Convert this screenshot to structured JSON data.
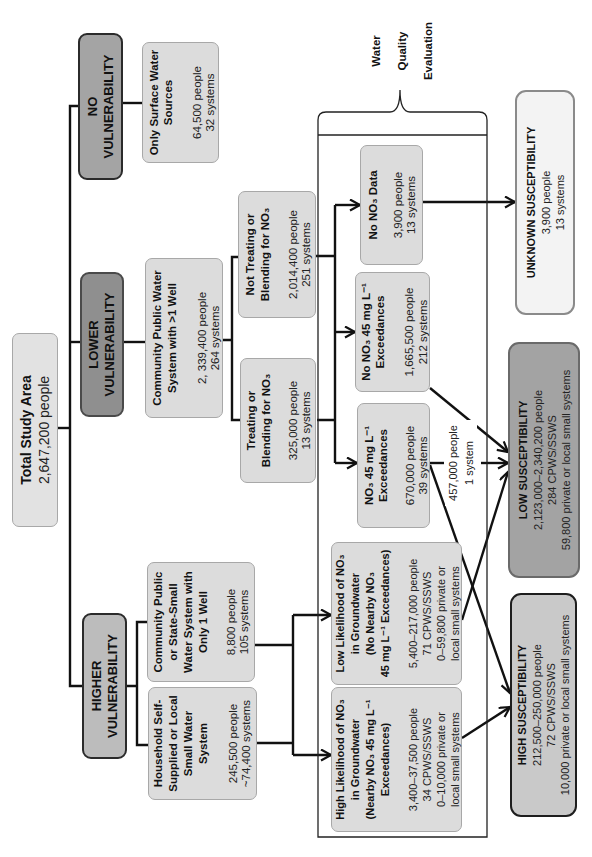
{
  "palette": {
    "light_fill": "#dcdcdc",
    "light_border": "#a8a8a8",
    "no_vuln": "#a4a4a4",
    "lower_vuln": "#8f8f8f",
    "higher_vuln": "#bcbcbc",
    "unknown_fill": "#f3f3f3",
    "low_fill": "#a3a3a3",
    "high_fill": "#c9c9c9",
    "line": "#111111"
  },
  "nodes": {
    "total": {
      "title": [
        "Total Study Area"
      ],
      "stats": [
        "2,647,200 people"
      ]
    },
    "no_vulnerability": {
      "title": [
        "NO",
        "VULNERABILITY"
      ]
    },
    "lower_vulnerability": {
      "title": [
        "LOWER",
        "VULNERABILITY"
      ]
    },
    "higher_vulnerability": {
      "title": [
        "HIGHER",
        "VULNERABILITY"
      ]
    },
    "surface_only": {
      "title": [
        "Only Surface Water",
        "Sources"
      ],
      "stats": [
        "64,500 people",
        "32 systems"
      ]
    },
    "cpws_multi_well": {
      "title": [
        "Community Public Water",
        "System with >1 Well"
      ],
      "stats": [
        "2, 339,400 people",
        "264 systems"
      ]
    },
    "cpws_single_well": {
      "title": [
        "Community Public",
        "or State-Small",
        "Water System with",
        "Only 1 Well"
      ],
      "stats": [
        "8,800 people",
        "105 systems"
      ]
    },
    "household": {
      "title": [
        "Household Self-",
        "Supplied or Local",
        "Small Water",
        "System"
      ],
      "stats": [
        "245,500 people",
        "~74,400 systems"
      ]
    },
    "not_treating": {
      "title": [
        "Not Treating or",
        "Blending for NO₃"
      ],
      "stats": [
        "2,014,400 people",
        "251 systems"
      ]
    },
    "treating": {
      "title": [
        "Treating or",
        "Blending for NO₃"
      ],
      "stats": [
        "325,000 people",
        "13 systems"
      ]
    },
    "no_data": {
      "title": [
        "No NO₃ Data"
      ],
      "stats": [
        "3,900 people",
        "13 systems"
      ]
    },
    "no_exceedances": {
      "title": [
        "No NO₃ 45 mg L⁻¹",
        "Exceedances"
      ],
      "stats": [
        "1,665,500 people",
        "212 systems"
      ]
    },
    "exceedances": {
      "title": [
        "NO₃ 45 mg L⁻¹",
        "Exceedances"
      ],
      "stats": [
        "670,000 people",
        "39 systems"
      ]
    },
    "low_likelihood": {
      "title": [
        "Low Likelihood of NO₃",
        "in Groundwater",
        "(No Nearby NO₃",
        "45 mg L⁻¹ Exceedances)"
      ],
      "stats": [
        "5,400–217,000 people",
        "71 CPWS/SSWS",
        "0–59,800 private or",
        "local small systems"
      ]
    },
    "high_likelihood": {
      "title": [
        "High Likelihood of NO₃",
        "in Groundwater",
        "(Nearby NO₃ 45 mg L⁻¹",
        "Exceedances)"
      ],
      "stats": [
        "3,400–37,500 people",
        "34 CPWS/SSWS",
        "0–10,000 private or",
        "local small systems"
      ]
    },
    "unknown_susceptibility": {
      "title": [
        "UNKNOWN SUSCEPTIBILITY"
      ],
      "stats": [
        "3,900 people",
        "13 systems"
      ]
    },
    "low_susceptibility": {
      "title": [
        "LOW SUSCEPTIBILITY"
      ],
      "stats": [
        "2,123,000–2,340,200 people",
        "284 CPWS/SSWS",
        "59,800 private or local small systems"
      ]
    },
    "high_susceptibility": {
      "title": [
        "HIGH SUSCEPTIBILITY"
      ],
      "stats": [
        "212,500–250,000 people",
        "72 CPWS/SSWS",
        "10,000 private or local small systems"
      ]
    }
  },
  "edge_labels": {
    "exceedances_to_low": [
      "457,000 people",
      "1 system"
    ]
  },
  "bracket": {
    "label": [
      "Water",
      "Quality",
      "Evaluation"
    ]
  }
}
